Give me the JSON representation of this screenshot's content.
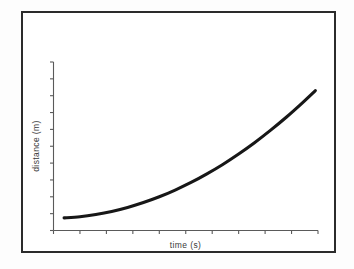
{
  "figure": {
    "background_color": "#ffffff",
    "frame_color": "#2b2b2b",
    "axis_color": "#5a5a5a",
    "curve_color": "#171717",
    "title": "",
    "xlabel": "time (s)",
    "ylabel": "distance (m)"
  },
  "chart_data": {
    "type": "line",
    "title": "",
    "xlabel": "time (s)",
    "ylabel": "distance (m)",
    "xlim": [
      0,
      10
    ],
    "ylim": [
      0,
      10
    ],
    "grid": false,
    "legend": null,
    "xtick_labels": [],
    "ytick_labels": [],
    "xtick_count": 10,
    "ytick_count": 10,
    "annotations": [],
    "series": [
      {
        "name": "distance",
        "x": [
          0.4,
          1.0,
          1.6,
          2.2,
          2.8,
          3.4,
          4.0,
          4.6,
          5.2,
          5.8,
          6.4,
          7.0,
          7.6,
          8.2,
          8.8,
          9.4,
          9.9
        ],
        "y": [
          0.75,
          0.82,
          0.95,
          1.13,
          1.37,
          1.66,
          2.0,
          2.4,
          2.85,
          3.36,
          3.92,
          4.54,
          5.21,
          5.94,
          6.72,
          7.56,
          8.3
        ]
      }
    ]
  }
}
